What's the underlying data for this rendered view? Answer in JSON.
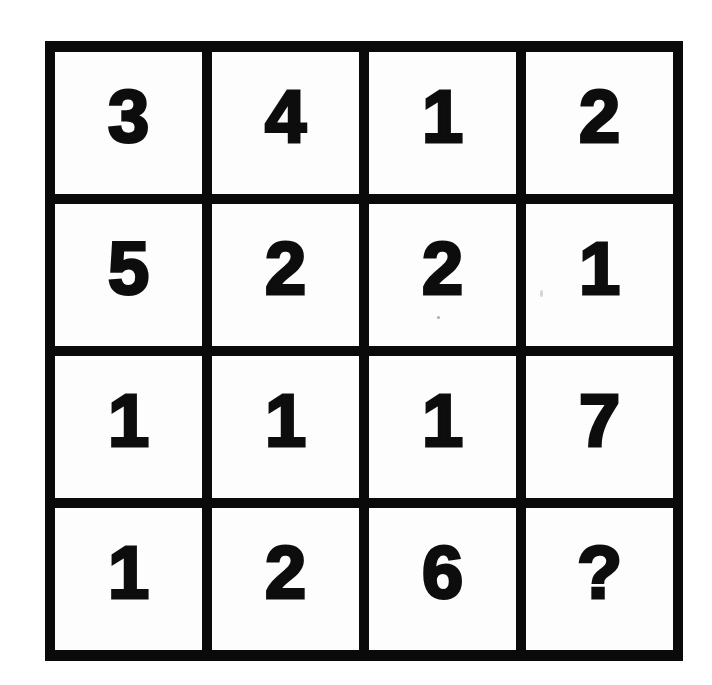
{
  "puzzle": {
    "type": "number-grid",
    "rows": 4,
    "cols": 4,
    "cells": [
      [
        "3",
        "4",
        "1",
        "2"
      ],
      [
        "5",
        "2",
        "2",
        "1"
      ],
      [
        "1",
        "1",
        "1",
        "7"
      ],
      [
        "1",
        "2",
        "6",
        "?"
      ]
    ],
    "missing_symbol": "?",
    "colors": {
      "grid_line": "#0a0a0a",
      "cell_background": "#fdfdfd",
      "text": "#0d0d0d"
    }
  }
}
